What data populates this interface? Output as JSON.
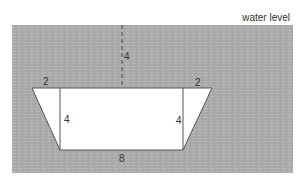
{
  "diagram": {
    "water_label": "water level",
    "colors": {
      "water": "#a9a9a9",
      "shape_fill": "#ffffff",
      "outline": "#555555"
    },
    "trapezoid": {
      "top_overhang_left": "2",
      "top_overhang_right": "2",
      "height_left": "4",
      "height_right": "4",
      "bottom_width": "8"
    },
    "depth_below_water": "4"
  }
}
